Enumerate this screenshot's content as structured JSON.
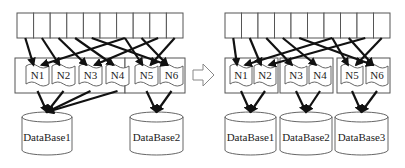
{
  "diagram": {
    "type": "data-partition-migration",
    "transition_arrow": "hollow-right-arrow",
    "colors": {
      "stroke": "#555555",
      "arrow": "#111111",
      "background": "#ffffff"
    },
    "before": {
      "slot_count": 10,
      "nodes": [
        "N1",
        "N2",
        "N3",
        "N4",
        "N5",
        "N6"
      ],
      "node_groups": [
        [
          "N1",
          "N2",
          "N3",
          "N4"
        ],
        [
          "N5",
          "N6"
        ]
      ],
      "databases": [
        "DataBase1",
        "DataBase2"
      ],
      "slot_to_node": [
        [
          0,
          "N1"
        ],
        [
          1,
          "N2"
        ],
        [
          2,
          "N3"
        ],
        [
          3,
          "N4"
        ],
        [
          6,
          "N5"
        ],
        [
          7,
          "N6"
        ],
        [
          6,
          "N1"
        ],
        [
          8,
          "N3"
        ],
        [
          9,
          "N5"
        ],
        [
          4,
          "N6"
        ]
      ],
      "node_to_db": [
        [
          "N1",
          "DataBase1"
        ],
        [
          "N2",
          "DataBase1"
        ],
        [
          "N3",
          "DataBase1"
        ],
        [
          "N4",
          "DataBase1"
        ],
        [
          "N5",
          "DataBase2"
        ],
        [
          "N6",
          "DataBase2"
        ]
      ]
    },
    "after": {
      "slot_count": 10,
      "nodes": [
        "N1",
        "N2",
        "N3",
        "N4",
        "N5",
        "N6"
      ],
      "node_groups": [
        [
          "N1",
          "N2"
        ],
        [
          "N3",
          "N4"
        ],
        [
          "N5",
          "N6"
        ]
      ],
      "databases": [
        "DataBase1",
        "DataBase2",
        "DataBase3"
      ],
      "slot_to_node": [
        [
          0,
          "N1"
        ],
        [
          1,
          "N2"
        ],
        [
          2,
          "N3"
        ],
        [
          3,
          "N4"
        ],
        [
          6,
          "N5"
        ],
        [
          7,
          "N6"
        ],
        [
          6,
          "N1"
        ],
        [
          8,
          "N2"
        ],
        [
          9,
          "N5"
        ],
        [
          4,
          "N6"
        ]
      ],
      "node_to_db": [
        [
          "N1",
          "DataBase1"
        ],
        [
          "N2",
          "DataBase1"
        ],
        [
          "N3",
          "DataBase2"
        ],
        [
          "N4",
          "DataBase2"
        ],
        [
          "N5",
          "DataBase3"
        ],
        [
          "N6",
          "DataBase3"
        ]
      ]
    }
  }
}
